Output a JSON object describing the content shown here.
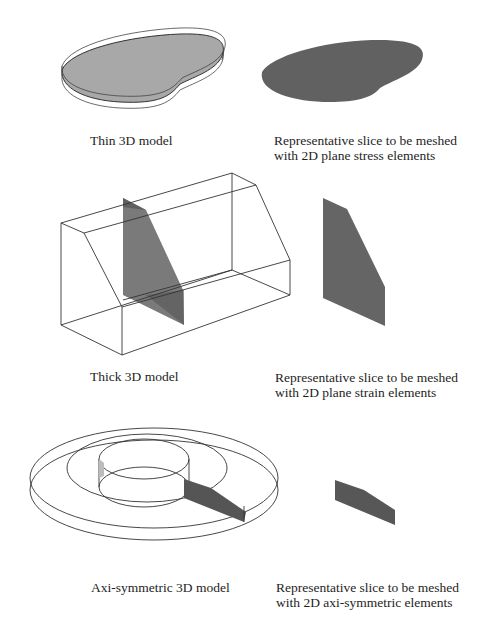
{
  "figure": {
    "rows": [
      {
        "id": "thin",
        "model_caption": "Thin 3D model",
        "slice_caption": [
          "Representative slice to be meshed",
          "with 2D plane stress elements"
        ]
      },
      {
        "id": "thick",
        "model_caption": "Thick 3D model",
        "slice_caption": [
          "Representative slice to be meshed",
          "with 2D plane strain elements"
        ]
      },
      {
        "id": "axisym",
        "model_caption": "Axi-symmetric 3D model",
        "slice_caption": [
          "Representative slice to be meshed",
          "with 2D axi-symmetric elements"
        ]
      }
    ],
    "colors": {
      "line": "#333333",
      "light_fill": "#a9a9a9",
      "dark_fill": "#5e5e5e",
      "slice_fill": "#606060"
    }
  }
}
